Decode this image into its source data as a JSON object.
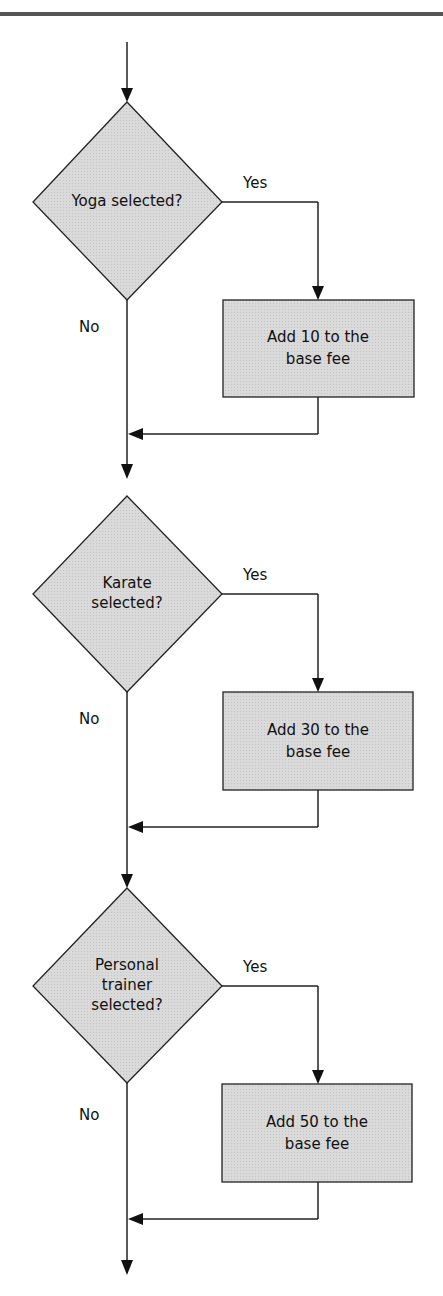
{
  "diagram": {
    "type": "flowchart",
    "decisions": [
      {
        "id": "d1",
        "lines": [
          "Yoga selected?"
        ],
        "yes_label": "Yes",
        "no_label": "No"
      },
      {
        "id": "d2",
        "lines": [
          "Karate",
          "selected?"
        ],
        "yes_label": "Yes",
        "no_label": "No"
      },
      {
        "id": "d3",
        "lines": [
          "Personal",
          "trainer",
          "selected?"
        ],
        "yes_label": "Yes",
        "no_label": "No"
      }
    ],
    "processes": [
      {
        "id": "p1",
        "lines": [
          "Add 10 to the",
          "base fee"
        ]
      },
      {
        "id": "p2",
        "lines": [
          "Add 30 to the",
          "base fee"
        ]
      },
      {
        "id": "p3",
        "lines": [
          "Add 50 to the",
          "base fee"
        ]
      }
    ],
    "colors": {
      "shape_fill": "#d6d6d6",
      "stroke": "#222222",
      "header_rule": "#555555"
    }
  }
}
